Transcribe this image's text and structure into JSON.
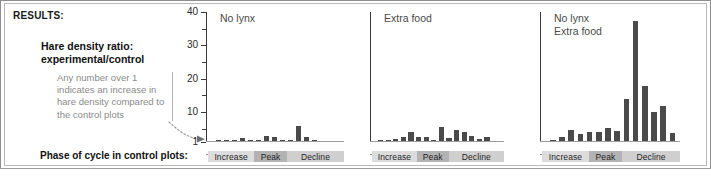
{
  "header": {
    "results_label": "RESULTS:"
  },
  "left_column": {
    "title": "Hare density ratio:\nexperimental/control",
    "explanation": "Any number over 1 indicates an increase in hare density compared to the control plots",
    "phase_caption": "Phase of cycle in control plots:",
    "arrow_icon": "dotted-arrow-icon"
  },
  "axis": {
    "labels": [
      "40",
      "30",
      "20",
      "10",
      "1"
    ],
    "label_values": [
      40,
      30,
      20,
      10,
      1
    ],
    "minor_ticks": [
      35,
      25,
      15,
      5
    ],
    "baseline_value": 1
  },
  "phase_segments": [
    {
      "label": "Increase",
      "color": "#dcdcdc"
    },
    {
      "label": "Peak",
      "color": "#b3b3b3"
    },
    {
      "label": "Decline",
      "color": "#cfcfcf"
    }
  ],
  "colors": {
    "bar": "#4a4a4a",
    "axis": "#3a3a3a",
    "explain_text": "#8a8a8a",
    "panel_title": "#4a4a4a",
    "frame": "#8e8e8e"
  },
  "chart_data": [
    {
      "type": "bar",
      "title": "No lynx",
      "ylabel": "Hare density ratio: experimental/control",
      "xlabel": "Phase of cycle in control plots",
      "ylim": [
        0,
        40
      ],
      "ytick_labels": [
        "1",
        "10",
        "20",
        "30",
        "40"
      ],
      "grid": false,
      "categories": [
        "1",
        "2",
        "3",
        "4",
        "5",
        "6",
        "7",
        "8",
        "9",
        "10",
        "11",
        "12",
        "13"
      ],
      "values": [
        1.0,
        1.1,
        1.2,
        1.9,
        1.0,
        1.3,
        2.6,
        2.1,
        1.2,
        1.3,
        5.6,
        2.3,
        1.2
      ],
      "extra_values": [
        3.0
      ],
      "phase_spans": {
        "Increase": [
          1,
          4
        ],
        "Peak": [
          5,
          6
        ],
        "Decline": [
          7,
          13
        ]
      }
    },
    {
      "type": "bar",
      "title": "Extra food",
      "ylabel": "Hare density ratio: experimental/control",
      "xlabel": "Phase of cycle in control plots",
      "ylim": [
        0,
        40
      ],
      "ytick_labels": [
        "1",
        "10",
        "20",
        "30",
        "40"
      ],
      "grid": false,
      "categories": [
        "1",
        "2",
        "3",
        "4",
        "5",
        "6",
        "7",
        "8",
        "9",
        "10",
        "11",
        "12",
        "13",
        "14",
        "15"
      ],
      "values": [
        1.0,
        1.3,
        1.7,
        2.1,
        3.6,
        2.2,
        2.1,
        1.4,
        5.1,
        1.9,
        4.3,
        3.6,
        2.4,
        1.7,
        2.2
      ],
      "phase_spans": {
        "Increase": [
          1,
          5
        ],
        "Peak": [
          6,
          7
        ],
        "Decline": [
          8,
          15
        ]
      }
    },
    {
      "type": "bar",
      "title": "No lynx\nExtra food",
      "ylabel": "Hare density ratio: experimental/control",
      "xlabel": "Phase of cycle in control plots",
      "ylim": [
        0,
        40
      ],
      "ytick_labels": [
        "1",
        "10",
        "20",
        "30",
        "40"
      ],
      "grid": false,
      "categories": [
        "1",
        "2",
        "3",
        "4",
        "5",
        "6",
        "7",
        "8",
        "9",
        "10",
        "11",
        "12",
        "13"
      ],
      "values": [
        1.0,
        2.2,
        4.2,
        3.2,
        3.7,
        3.8,
        4.9,
        3.9,
        13.5,
        37.0,
        17.5,
        9.7,
        11.5
      ],
      "trailing_value": 3.3,
      "phase_spans": {
        "Increase": [
          1,
          4
        ],
        "Peak": [
          5,
          6
        ],
        "Decline": [
          7,
          13
        ]
      }
    }
  ]
}
